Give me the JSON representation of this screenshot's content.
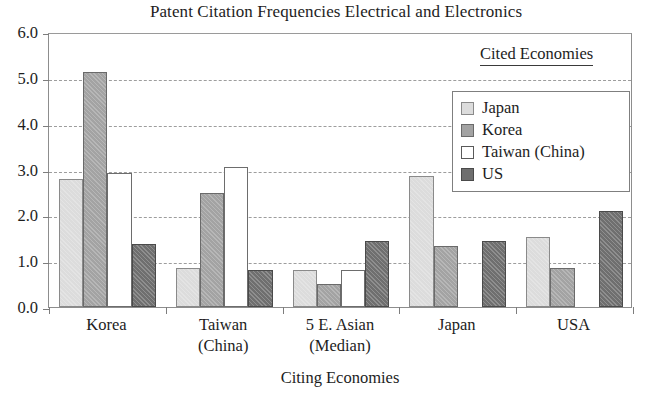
{
  "chart_data": {
    "type": "bar",
    "title": "Patent Citation Frequencies Electrical and Electronics",
    "xlabel": "Citing Economies",
    "ylabel": "",
    "legend_title": "Cited Economies",
    "legend_position": "top-right-inside",
    "grid": true,
    "ylim": [
      0.0,
      6.0
    ],
    "ytick_step": 1.0,
    "ytick_labels": [
      "0.0",
      "1.0",
      "2.0",
      "3.0",
      "4.0",
      "5.0",
      "6.0"
    ],
    "ytick_values": [
      0.0,
      1.0,
      2.0,
      3.0,
      4.0,
      5.0,
      6.0
    ],
    "categories": [
      "Korea",
      "Taiwan (China)",
      "5 E. Asian (Median)",
      "Japan",
      "USA"
    ],
    "category_lines": [
      [
        "Korea"
      ],
      [
        "Taiwan",
        "(China)"
      ],
      [
        "5 E. Asian",
        "(Median)"
      ],
      [
        "Japan"
      ],
      [
        "USA"
      ]
    ],
    "series": [
      {
        "name": "Japan",
        "color": "#dcdcdc",
        "values": [
          2.8,
          0.85,
          0.8,
          2.85,
          1.52
        ]
      },
      {
        "name": "Korea",
        "color": "#a3a3a3",
        "values": [
          5.12,
          2.48,
          0.5,
          1.33,
          0.85
        ]
      },
      {
        "name": "Taiwan (China)",
        "color": "#ffffff",
        "values": [
          2.92,
          3.06,
          0.8,
          0.0,
          0.0
        ]
      },
      {
        "name": "US",
        "color": "#6f6f6f",
        "values": [
          1.38,
          0.8,
          1.43,
          1.43,
          2.1
        ]
      }
    ]
  }
}
